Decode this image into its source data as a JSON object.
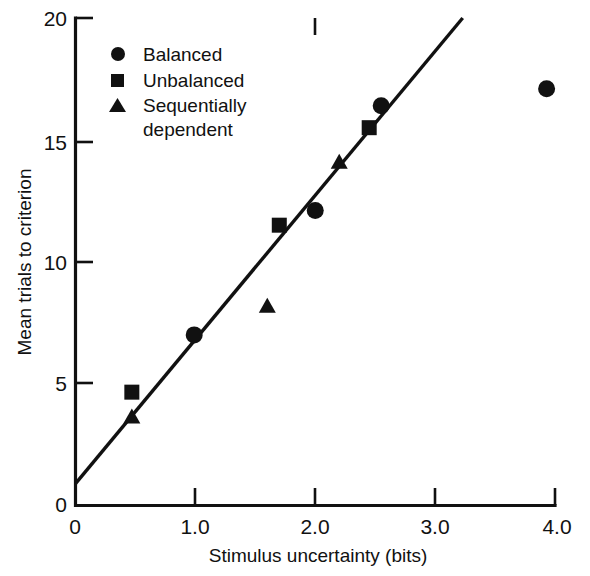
{
  "chart_data": {
    "type": "scatter",
    "title": "",
    "xlabel": "Stimulus uncertainty (bits)",
    "ylabel": "Mean trials to criterion",
    "xlim": [
      0,
      4.0
    ],
    "ylim": [
      0,
      20
    ],
    "grid": false,
    "legend_position": "top-left inside axes",
    "xticks": [
      "0",
      "1.0",
      "2.0",
      "3.0",
      "4.0"
    ],
    "xtick_values": [
      0,
      1.0,
      2.0,
      3.0,
      4.0
    ],
    "yticks": [
      "0",
      "5",
      "10",
      "15",
      "20"
    ],
    "ytick_values": [
      0,
      5,
      10,
      15,
      20
    ],
    "series": [
      {
        "name": "Balanced",
        "marker": "circle",
        "color": "#111111",
        "points": [
          {
            "x": 0.99,
            "y": 7.0
          },
          {
            "x": 2.0,
            "y": 12.1
          },
          {
            "x": 2.55,
            "y": 16.4
          },
          {
            "x": 3.93,
            "y": 17.1
          }
        ]
      },
      {
        "name": "Unbalanced",
        "marker": "square",
        "color": "#111111",
        "points": [
          {
            "x": 0.47,
            "y": 4.65
          },
          {
            "x": 1.7,
            "y": 11.5
          },
          {
            "x": 2.45,
            "y": 15.5
          }
        ]
      },
      {
        "name": "Sequentially dependent",
        "marker": "triangle",
        "color": "#111111",
        "points": [
          {
            "x": 0.47,
            "y": 3.65
          },
          {
            "x": 1.6,
            "y": 8.2
          },
          {
            "x": 2.2,
            "y": 14.1
          }
        ]
      }
    ],
    "trendline": {
      "name": "fitted line",
      "x_start": 0.0,
      "y_start": 0.9,
      "x_end": 3.23,
      "y_end": 20.0
    }
  },
  "legend": {
    "items": [
      {
        "label": "Balanced",
        "marker": "circle"
      },
      {
        "label": "Unbalanced",
        "marker": "square"
      },
      {
        "label": "Sequentially",
        "label2": "dependent",
        "marker": "triangle"
      }
    ]
  },
  "axes": {
    "x_title": "Stimulus uncertainty (bits)",
    "y_title": "Mean trials to criterion",
    "x_tick_labels": [
      "0",
      "1.0",
      "2.0",
      "3.0",
      "4.0"
    ],
    "y_tick_labels": [
      "0",
      "5",
      "10",
      "15",
      "20"
    ]
  }
}
